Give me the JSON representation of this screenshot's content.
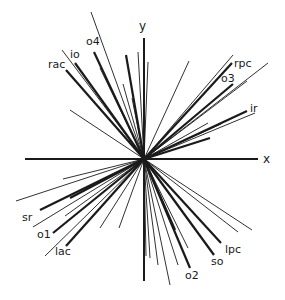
{
  "diagram": {
    "origin": [
      144,
      159
    ],
    "colors": {
      "ink": "#1a1a1a",
      "background": "#ffffff"
    },
    "axes": {
      "x": {
        "label": "x",
        "from": [
          25,
          159
        ],
        "to": [
          258,
          159
        ],
        "label_pos": [
          263,
          163
        ]
      },
      "y": {
        "label": "y",
        "from": [
          144,
          281
        ],
        "to": [
          144,
          38
        ],
        "label_pos": [
          139,
          30
        ]
      }
    },
    "labels": [
      {
        "id": "rac",
        "text": "rac",
        "pos": [
          48,
          68
        ]
      },
      {
        "id": "io",
        "text": "io",
        "pos": [
          70,
          58
        ]
      },
      {
        "id": "o4",
        "text": "o4",
        "pos": [
          86,
          45
        ]
      },
      {
        "id": "rpc",
        "text": "rpc",
        "pos": [
          234,
          67
        ]
      },
      {
        "id": "o3",
        "text": "o3",
        "pos": [
          221,
          82
        ]
      },
      {
        "id": "ir",
        "text": "ir",
        "pos": [
          250,
          112
        ]
      },
      {
        "id": "sr",
        "text": "sr",
        "pos": [
          22,
          221
        ]
      },
      {
        "id": "o1",
        "text": "o1",
        "pos": [
          37,
          238
        ]
      },
      {
        "id": "lac",
        "text": "lac",
        "pos": [
          55,
          255
        ]
      },
      {
        "id": "lpc",
        "text": "lpc",
        "pos": [
          225,
          253
        ]
      },
      {
        "id": "so",
        "text": "so",
        "pos": [
          211,
          265
        ]
      },
      {
        "id": "o2",
        "text": "o2",
        "pos": [
          185,
          279
        ]
      }
    ],
    "thick_vectors": [
      {
        "name": "rac",
        "end": [
          66,
          70
        ]
      },
      {
        "name": "io",
        "end": [
          75,
          63
        ]
      },
      {
        "name": "o4",
        "end": [
          94,
          52
        ]
      },
      {
        "name": "rpc",
        "end": [
          232,
          63
        ]
      },
      {
        "name": "o3",
        "end": [
          233,
          84
        ]
      },
      {
        "name": "ir",
        "end": [
          247,
          111
        ]
      },
      {
        "name": "sr",
        "end": [
          40,
          210
        ]
      },
      {
        "name": "o1",
        "end": [
          53,
          233
        ]
      },
      {
        "name": "lac",
        "end": [
          66,
          246
        ]
      },
      {
        "name": "lpc",
        "end": [
          221,
          243
        ]
      },
      {
        "name": "so",
        "end": [
          214,
          255
        ]
      },
      {
        "name": "o2",
        "end": [
          190,
          268
        ]
      },
      {
        "name": "v1",
        "end": [
          126,
          55
        ]
      },
      {
        "name": "v2",
        "end": [
          210,
          138
        ]
      },
      {
        "name": "v3",
        "end": [
          70,
          198
        ]
      },
      {
        "name": "v4",
        "end": [
          175,
          230
        ]
      }
    ],
    "thin_vectors": [
      [
        91,
        12
      ],
      [
        62,
        50
      ],
      [
        70,
        110
      ],
      [
        100,
        68
      ],
      [
        123,
        84
      ],
      [
        132,
        98
      ],
      [
        138,
        52
      ],
      [
        148,
        62
      ],
      [
        189,
        61
      ],
      [
        233,
        55
      ],
      [
        268,
        63
      ],
      [
        247,
        81
      ],
      [
        255,
        113
      ],
      [
        221,
        124
      ],
      [
        208,
        123
      ],
      [
        16,
        201
      ],
      [
        63,
        179
      ],
      [
        33,
        227
      ],
      [
        45,
        256
      ],
      [
        65,
        216
      ],
      [
        100,
        228
      ],
      [
        119,
        228
      ],
      [
        150,
        258
      ],
      [
        158,
        265
      ],
      [
        170,
        285
      ],
      [
        178,
        265
      ],
      [
        188,
        248
      ],
      [
        238,
        232
      ],
      [
        252,
        230
      ],
      [
        146,
        256
      ]
    ]
  }
}
